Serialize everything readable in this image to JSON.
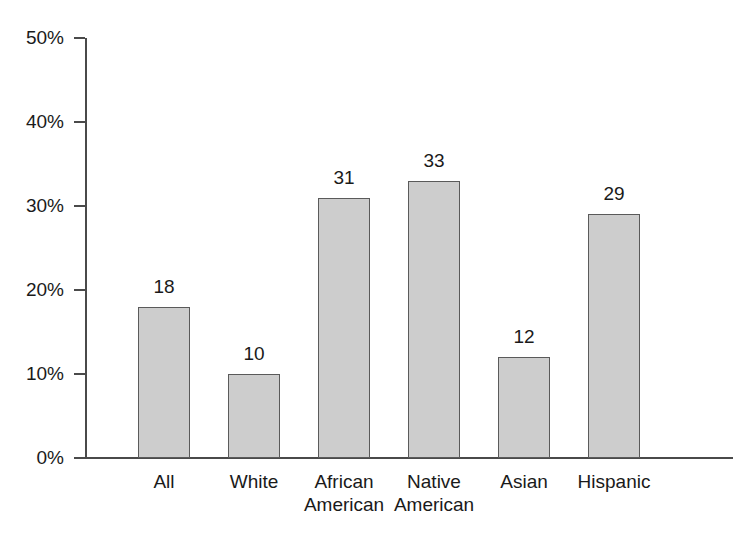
{
  "chart_data": {
    "type": "bar",
    "title": "",
    "subtitle": "",
    "xlabel": "",
    "ylabel": "",
    "categories": [
      "All",
      "White",
      "African American",
      "Native American",
      "Asian",
      "Hispanic"
    ],
    "category_lines": [
      [
        "All"
      ],
      [
        "White"
      ],
      [
        "African",
        "American"
      ],
      [
        "Native",
        "American"
      ],
      [
        "Asian"
      ],
      [
        "Hispanic"
      ]
    ],
    "values": [
      18,
      10,
      31,
      33,
      12,
      29
    ],
    "value_labels": [
      "18",
      "10",
      "31",
      "33",
      "12",
      "29"
    ],
    "ylim": [
      0,
      50
    ],
    "y_ticks": [
      0,
      10,
      20,
      30,
      40,
      50
    ],
    "y_tick_labels": [
      "0%",
      "10%",
      "20%",
      "30%",
      "40%",
      "50%"
    ],
    "grid": false,
    "legend": false,
    "legend_position": "none",
    "bar_fill_color": "#cdcdcd",
    "bar_edge_color": "#5a5a5a",
    "axis_color": "#4a4a4a",
    "text_color": "#1a1a1a",
    "background_color": "#ffffff"
  }
}
